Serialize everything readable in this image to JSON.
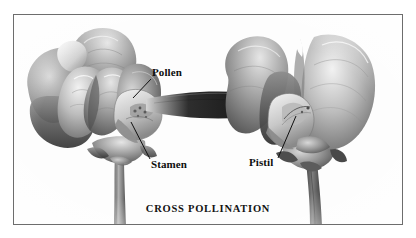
{
  "figure": {
    "caption": "CROSS POLLINATION",
    "medium": "grayscale pencil botanical illustration",
    "background_color": "#ffffff",
    "frame_color": "#6d6d6d",
    "ink_color": "#0d0d0d"
  },
  "labels": [
    {
      "id": "pollen",
      "text": "Pollen",
      "points_to": "anther tip inside the left flower's keel",
      "leader": {
        "x1": 151,
        "y1": 79,
        "x2": 133,
        "y2": 98
      }
    },
    {
      "id": "stamen",
      "text": "Stamen",
      "points_to": "stamen column at the base of the left flower",
      "leader": {
        "x1": 150,
        "y1": 159,
        "x2": 131,
        "y2": 122
      }
    },
    {
      "id": "pistil",
      "text": "Pistil",
      "points_to": "pistil inside the right flower",
      "leader": {
        "x1": 278,
        "y1": 158,
        "x2": 296,
        "y2": 116
      }
    }
  ],
  "flowers": [
    {
      "id": "left-flower",
      "position": "left",
      "role": "pollen donor",
      "parts": [
        "standard petal",
        "wing petals",
        "keel",
        "stamen",
        "calyx",
        "stem"
      ]
    },
    {
      "id": "right-flower",
      "position": "right",
      "role": "pollen receiver",
      "parts": [
        "standard petal",
        "wing petals",
        "keel",
        "pistil",
        "calyx",
        "stem"
      ]
    }
  ],
  "bridge": {
    "id": "pollen-bridge",
    "description": "dark tapered band carrying pollen from the left flower to the right flower",
    "color": "#2b2b2b"
  }
}
